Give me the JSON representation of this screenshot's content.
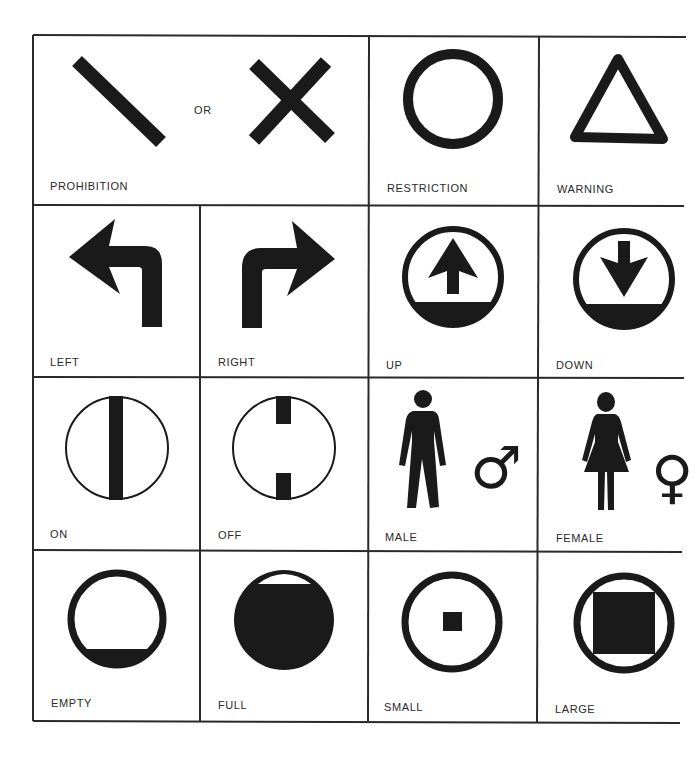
{
  "colors": {
    "ink": "#1a1a1a",
    "grid": "#2a2a2a",
    "background": "#ffffff"
  },
  "rows": [
    {
      "cells": [
        {
          "id": "prohibition",
          "label": "PROHIBITION",
          "icon": "prohibition-slash-or-cross",
          "connector": "OR"
        },
        {
          "id": "restriction",
          "label": "RESTRICTION",
          "icon": "circle-ring"
        },
        {
          "id": "warning",
          "label": "WARNING",
          "icon": "triangle-outline"
        }
      ]
    },
    {
      "cells": [
        {
          "id": "left",
          "label": "LEFT",
          "icon": "left-turn-arrow"
        },
        {
          "id": "right",
          "label": "RIGHT",
          "icon": "right-turn-arrow"
        },
        {
          "id": "up",
          "label": "UP",
          "icon": "up-arrow-in-circle"
        },
        {
          "id": "down",
          "label": "DOWN",
          "icon": "down-arrow-in-circle"
        }
      ]
    },
    {
      "cells": [
        {
          "id": "on",
          "label": "ON",
          "icon": "circle-full-bar"
        },
        {
          "id": "off",
          "label": "OFF",
          "icon": "circle-broken-bar"
        },
        {
          "id": "male",
          "label": "MALE",
          "icon": "male-figure",
          "symbol": "♂"
        },
        {
          "id": "female",
          "label": "FEMALE",
          "icon": "female-figure",
          "symbol": "♀"
        }
      ]
    },
    {
      "cells": [
        {
          "id": "empty",
          "label": "EMPTY",
          "icon": "circle-low-fill"
        },
        {
          "id": "full",
          "label": "FULL",
          "icon": "circle-high-fill"
        },
        {
          "id": "small",
          "label": "SMALL",
          "icon": "circle-small-square"
        },
        {
          "id": "large",
          "label": "LARGE",
          "icon": "circle-large-square"
        }
      ]
    }
  ]
}
